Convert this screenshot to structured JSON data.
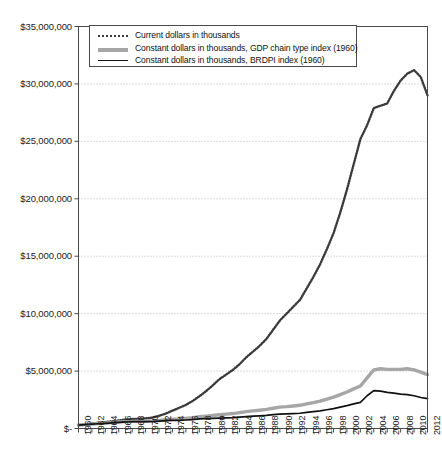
{
  "chart_data": {
    "type": "line",
    "title": "",
    "xlabel": "",
    "ylabel": "",
    "ylim": [
      0,
      35000000
    ],
    "xlim": [
      1960,
      2012
    ],
    "grid": true,
    "legend_position": "top-left inside plot area",
    "ytick_labels": [
      "$35,000,000",
      "$30,000,000",
      "$25,000,000",
      "$20,000,000",
      "$15,000,000",
      "$10,000,000",
      "$5,000,000",
      "$-"
    ],
    "ytick_values": [
      35000000,
      30000000,
      25000000,
      20000000,
      15000000,
      10000000,
      5000000,
      0
    ],
    "xtick_labels": [
      "1960",
      "1962",
      "1964",
      "1966",
      "1968",
      "1970",
      "1972",
      "1974",
      "1976",
      "1978",
      "1980",
      "1982",
      "1984",
      "1986",
      "1988",
      "1990",
      "1992",
      "1994",
      "1996",
      "1998",
      "2000",
      "2002",
      "2004",
      "2006",
      "2008",
      "2010",
      "2012"
    ],
    "x": [
      1960,
      1961,
      1962,
      1963,
      1964,
      1965,
      1966,
      1967,
      1968,
      1969,
      1970,
      1971,
      1972,
      1973,
      1974,
      1975,
      1976,
      1977,
      1978,
      1979,
      1980,
      1981,
      1982,
      1983,
      1984,
      1985,
      1986,
      1987,
      1988,
      1989,
      1990,
      1991,
      1992,
      1993,
      1994,
      1995,
      1996,
      1997,
      1998,
      1999,
      2000,
      2001,
      2002,
      2003,
      2004,
      2005,
      2006,
      2007,
      2008,
      2009,
      2010,
      2011,
      2012
    ],
    "series": [
      {
        "name": "Current dollars in thousands",
        "style": "dotted",
        "color": "#3a3a3a",
        "values": [
          300000,
          360000,
          430000,
          500000,
          560000,
          620000,
          700000,
          780000,
          820000,
          850000,
          880000,
          950000,
          1100000,
          1300000,
          1550000,
          1800000,
          2050000,
          2400000,
          2800000,
          3250000,
          3750000,
          4300000,
          4700000,
          5100000,
          5600000,
          6200000,
          6700000,
          7200000,
          7800000,
          8600000,
          9400000,
          10000000,
          10600000,
          11200000,
          12200000,
          13200000,
          14300000,
          15600000,
          17000000,
          18800000,
          20800000,
          23000000,
          25200000,
          26400000,
          27900000,
          28100000,
          28300000,
          29400000,
          30300000,
          30900000,
          31200000,
          30600000,
          29000000
        ]
      },
      {
        "name": "Constant dollars in thousands, GDP chain type index (1960)",
        "style": "thick-gray",
        "color": "#a6a6a6",
        "values": [
          300000,
          340000,
          390000,
          430000,
          470000,
          510000,
          560000,
          600000,
          620000,
          630000,
          630000,
          650000,
          700000,
          760000,
          800000,
          830000,
          880000,
          940000,
          1020000,
          1080000,
          1130000,
          1200000,
          1250000,
          1300000,
          1380000,
          1470000,
          1530000,
          1590000,
          1660000,
          1760000,
          1860000,
          1900000,
          1960000,
          2020000,
          2140000,
          2260000,
          2390000,
          2550000,
          2730000,
          2950000,
          3180000,
          3450000,
          3700000,
          4400000,
          5100000,
          5200000,
          5150000,
          5150000,
          5150000,
          5200000,
          5100000,
          4900000,
          4700000
        ]
      },
      {
        "name": "Constant dollars in thousands, BRDPI index (1960)",
        "style": "thin-black",
        "color": "#111111",
        "values": [
          300000,
          335000,
          380000,
          415000,
          450000,
          490000,
          530000,
          570000,
          590000,
          600000,
          600000,
          610000,
          640000,
          680000,
          700000,
          710000,
          740000,
          780000,
          830000,
          860000,
          880000,
          910000,
          930000,
          950000,
          990000,
          1040000,
          1070000,
          1100000,
          1140000,
          1200000,
          1250000,
          1270000,
          1300000,
          1330000,
          1400000,
          1470000,
          1540000,
          1630000,
          1730000,
          1860000,
          1990000,
          2140000,
          2280000,
          2850000,
          3300000,
          3250000,
          3150000,
          3080000,
          3000000,
          2950000,
          2850000,
          2700000,
          2600000
        ]
      }
    ]
  },
  "legend": {
    "items": [
      {
        "label": "Current dollars in thousands",
        "swatch": "dotted-line-swatch"
      },
      {
        "label": "Constant dollars in thousands, GDP chain type index (1960)",
        "swatch": "thick-gray-line-swatch"
      },
      {
        "label": "Constant dollars in thousands, BRDPI index (1960)",
        "swatch": "thin-black-line-swatch"
      }
    ]
  }
}
